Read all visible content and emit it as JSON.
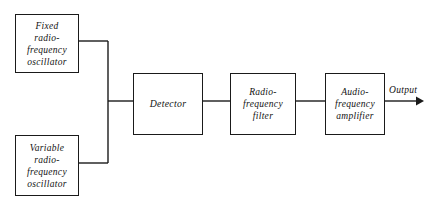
{
  "diagram": {
    "stroke_color": "#1a1a1a",
    "background_color": "#ffffff",
    "blocks": [
      {
        "id": "fixed-oscillator",
        "label": "Fixed\nradio-frequency\noscillator"
      },
      {
        "id": "variable-oscillator",
        "label": "Variable\nradio-frequency\noscillator"
      },
      {
        "id": "detector",
        "label": "Detector"
      },
      {
        "id": "rf-filter",
        "label": "Radio-frequency\nfilter"
      },
      {
        "id": "af-amplifier",
        "label": "Audio-frequency\namplifier"
      }
    ],
    "output": {
      "label": "Output"
    }
  }
}
